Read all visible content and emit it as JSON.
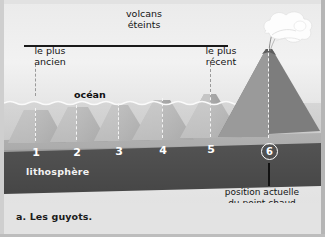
{
  "figure": {
    "caption": "a. Les guyots.",
    "title_block": {
      "line1": "volcans",
      "line2": "éteints"
    },
    "labels": {
      "oldest_line1": "le plus",
      "oldest_line2": "ancien",
      "newest_line1": "le plus",
      "newest_line2": "récent",
      "ocean": "océan",
      "lithosphere": "lithosphère",
      "hotspot_line1": "position actuelle",
      "hotspot_line2": "du point chaud"
    },
    "seamounts": [
      {
        "id": "1",
        "label": "1",
        "circled": false,
        "state": "extinct",
        "emerged": false
      },
      {
        "id": "2",
        "label": "2",
        "circled": false,
        "state": "extinct",
        "emerged": false
      },
      {
        "id": "3",
        "label": "3",
        "circled": false,
        "state": "extinct",
        "emerged": false
      },
      {
        "id": "4",
        "label": "4",
        "circled": false,
        "state": "extinct",
        "emerged": false
      },
      {
        "id": "5",
        "label": "5",
        "circled": false,
        "state": "extinct",
        "emerged": false
      },
      {
        "id": "6",
        "label": "6",
        "circled": true,
        "state": "active",
        "emerged": true
      }
    ],
    "colors": {
      "sky": "#eeeeee",
      "ocean_water": "#bfbfbf",
      "seamount": "#9b9b9b",
      "seamount_light": "#cbcbcb",
      "lithosphere": "#4b4b4b",
      "mantle": "#eaeaea",
      "plume": "#fdfdfd",
      "ink": "#141414",
      "white_text": "#ffffff",
      "caption_band": "#e3e3e3"
    }
  }
}
